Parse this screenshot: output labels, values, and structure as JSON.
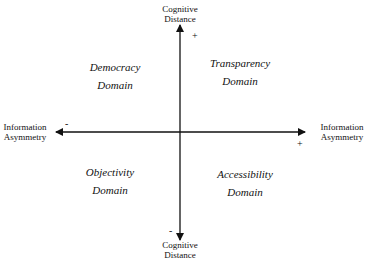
{
  "axes": {
    "vertical": {
      "top_label": [
        "Cognitive",
        "Distance"
      ],
      "bottom_label": [
        "Cognitive",
        "Distance"
      ],
      "positive_sign": "+",
      "negative_sign": "-"
    },
    "horizontal": {
      "left_label": [
        "Information",
        "Asymmetry"
      ],
      "right_label": [
        "Information",
        "Asymmetry"
      ],
      "positive_sign": "+",
      "negative_sign": "-"
    }
  },
  "quadrants": {
    "top_left": [
      "Democracy",
      "Domain"
    ],
    "top_right": [
      "Transparency",
      "Domain"
    ],
    "bottom_left": [
      "Objectivity",
      "Domain"
    ],
    "bottom_right": [
      "Accessibility",
      "Domain"
    ]
  }
}
